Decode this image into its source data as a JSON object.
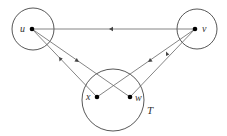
{
  "diagram": {
    "labels": {
      "u": "u",
      "v": "v",
      "x": "x",
      "w": "w",
      "T": "T"
    },
    "colors": {
      "stroke": "#444444",
      "vertex": "#000000",
      "background": "#ffffff"
    },
    "nodes": [
      {
        "id": "u",
        "x": 32,
        "y": 29
      },
      {
        "id": "v",
        "x": 195,
        "y": 29
      },
      {
        "id": "x",
        "x": 97,
        "y": 97
      },
      {
        "id": "w",
        "x": 130,
        "y": 97
      }
    ],
    "edges": [
      {
        "from": "v",
        "to": "u",
        "arrow": "toward-u"
      },
      {
        "from": "u",
        "to": "x",
        "arrow": "toward-u"
      },
      {
        "from": "u",
        "to": "w",
        "arrow": "toward-w"
      },
      {
        "from": "v",
        "to": "x",
        "arrow": "toward-x"
      },
      {
        "from": "v",
        "to": "w",
        "arrow": "toward-v"
      }
    ],
    "circles": [
      {
        "id": "circle-u",
        "cx": 33,
        "cy": 29,
        "r": 21
      },
      {
        "id": "circle-v",
        "cx": 197,
        "cy": 29,
        "r": 20
      },
      {
        "id": "circle-T",
        "cx": 113,
        "cy": 100,
        "r": 31
      }
    ]
  }
}
